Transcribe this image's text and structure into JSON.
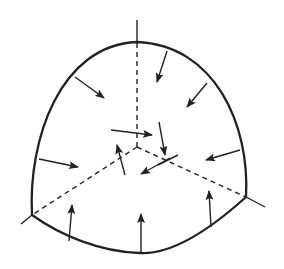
{
  "diagram": {
    "title": "",
    "colors": {
      "stroke": "#222222",
      "background": "#ffffff"
    },
    "outline": {
      "top": [
        137,
        42
      ],
      "left_corner": [
        32,
        215
      ],
      "right_corner": [
        246,
        197
      ],
      "bottom_low": [
        140,
        253
      ]
    },
    "center": [
      137,
      147
    ],
    "axes": [
      {
        "name": "vertical-axis",
        "from": [
          137,
          147
        ],
        "to": [
          137,
          42
        ],
        "extension_to": [
          137,
          20
        ]
      },
      {
        "name": "left-axis",
        "from": [
          137,
          147
        ],
        "to": [
          32,
          215
        ],
        "extension_to": [
          21,
          224
        ]
      },
      {
        "name": "right-axis",
        "from": [
          137,
          147
        ],
        "to": [
          246,
          197
        ],
        "extension_to": [
          265,
          207
        ]
      }
    ],
    "boundary_arrows": [
      {
        "from": [
          75,
          77
        ],
        "to": [
          104,
          98
        ]
      },
      {
        "from": [
          167,
          51
        ],
        "to": [
          157,
          82
        ]
      },
      {
        "from": [
          207,
          83
        ],
        "to": [
          187,
          107
        ]
      },
      {
        "from": [
          39,
          159
        ],
        "to": [
          78,
          167
        ]
      },
      {
        "from": [
          240,
          150
        ],
        "to": [
          206,
          160
        ]
      },
      {
        "from": [
          69,
          241
        ],
        "to": [
          72,
          205
        ]
      },
      {
        "from": [
          141,
          253
        ],
        "to": [
          141,
          214
        ]
      },
      {
        "from": [
          211,
          227
        ],
        "to": [
          209,
          191
        ]
      }
    ],
    "interior_arrows": [
      {
        "from": [
          111,
          130
        ],
        "to": [
          152,
          135
        ]
      },
      {
        "from": [
          159,
          122
        ],
        "to": [
          165,
          155
        ]
      },
      {
        "from": [
          125,
          175
        ],
        "to": [
          117,
          145
        ]
      },
      {
        "from": [
          170,
          158
        ],
        "to": [
          141,
          174
        ]
      }
    ],
    "interior_tick": {
      "from": [
        158,
        165
      ],
      "to": [
        178,
        155
      ]
    }
  }
}
